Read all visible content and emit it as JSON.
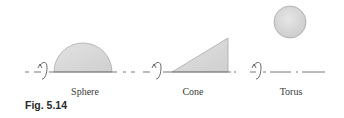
{
  "figure": {
    "caption": "Fig. 5.14",
    "colors": {
      "shape_fill": "#d6d6d6",
      "shape_stroke": "#9a9a9a",
      "axis": "#555555",
      "text": "#3a3a3a"
    },
    "panels": [
      {
        "id": "sphere",
        "label": "Sphere",
        "shape": "half-disk",
        "icon": "rotation-arrow-icon"
      },
      {
        "id": "cone",
        "label": "Cone",
        "shape": "right-triangle",
        "icon": "rotation-arrow-icon"
      },
      {
        "id": "torus",
        "label": "Torus",
        "shape": "disk-offset-from-axis",
        "icon": "rotation-arrow-icon"
      }
    ]
  }
}
